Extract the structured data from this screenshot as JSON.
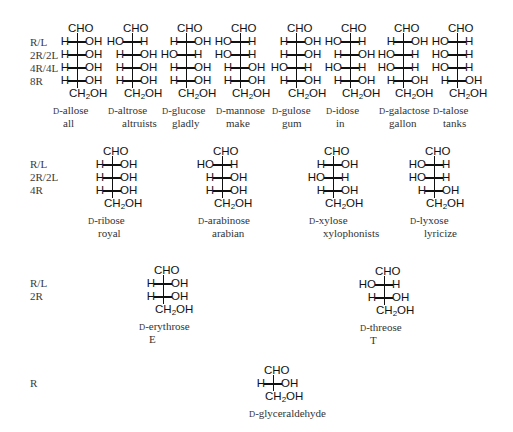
{
  "rows": [
    {
      "labels": [
        "R/L",
        "2R/2L",
        "4R/4L",
        "8R"
      ],
      "label_y": 36,
      "structures": [
        {
          "name": "D-allose",
          "mnemonic": "all",
          "x": 77,
          "y": 22,
          "centers": [
            "R",
            "R",
            "R",
            "R"
          ]
        },
        {
          "name": "D-altrose",
          "mnemonic": "altruists",
          "x": 132,
          "y": 22,
          "centers": [
            "L",
            "R",
            "R",
            "R"
          ]
        },
        {
          "name": "D-glucose",
          "mnemonic": "gladly",
          "x": 186,
          "y": 22,
          "centers": [
            "R",
            "L",
            "R",
            "R"
          ]
        },
        {
          "name": "D-mannose",
          "mnemonic": "make",
          "x": 240,
          "y": 22,
          "centers": [
            "L",
            "L",
            "R",
            "R"
          ]
        },
        {
          "name": "D-gulose",
          "mnemonic": "gum",
          "x": 296,
          "y": 22,
          "centers": [
            "R",
            "R",
            "L",
            "R"
          ]
        },
        {
          "name": "D-idose",
          "mnemonic": "in",
          "x": 350,
          "y": 22,
          "centers": [
            "L",
            "R",
            "L",
            "R"
          ]
        },
        {
          "name": "D-galactose",
          "mnemonic": "gallon",
          "x": 403,
          "y": 22,
          "centers": [
            "R",
            "L",
            "L",
            "R"
          ]
        },
        {
          "name": "D-talose",
          "mnemonic": "tanks",
          "x": 457,
          "y": 22,
          "centers": [
            "L",
            "L",
            "L",
            "R"
          ]
        }
      ]
    },
    {
      "labels": [
        "R/L",
        "2R/2L",
        "4R"
      ],
      "label_y": 158,
      "structures": [
        {
          "name": "D-ribose",
          "mnemonic": "royal",
          "x": 112,
          "y": 145,
          "centers": [
            "R",
            "R",
            "R"
          ]
        },
        {
          "name": "D-arabinose",
          "mnemonic": "arabian",
          "x": 222,
          "y": 145,
          "centers": [
            "L",
            "R",
            "R"
          ]
        },
        {
          "name": "D-xylose",
          "mnemonic": "xylophonists",
          "x": 333,
          "y": 145,
          "centers": [
            "R",
            "L",
            "R"
          ]
        },
        {
          "name": "D-lyxose",
          "mnemonic": "lyricize",
          "x": 434,
          "y": 145,
          "centers": [
            "L",
            "L",
            "R"
          ]
        }
      ]
    },
    {
      "labels": [
        "R/L",
        "2R"
      ],
      "label_y": 277,
      "structures": [
        {
          "name": "D-erythrose",
          "mnemonic": "E",
          "x": 163,
          "y": 264,
          "centers": [
            "R",
            "R"
          ]
        },
        {
          "name": "D-threose",
          "mnemonic": "T",
          "x": 384,
          "y": 265,
          "centers": [
            "L",
            "R"
          ]
        }
      ]
    },
    {
      "labels": [
        "R"
      ],
      "label_y": 377,
      "structures": [
        {
          "name": "D-glyceraldehyde",
          "mnemonic": "",
          "x": 273,
          "y": 364,
          "centers": [
            "R"
          ]
        }
      ]
    }
  ],
  "groups": {
    "top": "CHO",
    "bottom_main": "CH",
    "bottom_sub": "2",
    "bottom_tail": "OH",
    "h": "H",
    "oh": "OH",
    "ho": "HO"
  }
}
